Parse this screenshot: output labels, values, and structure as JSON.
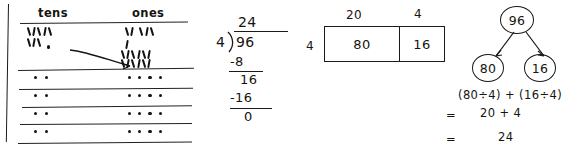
{
  "place_value_chart": {
    "headers": {
      "tens": "tens",
      "ones": "ones"
    },
    "regroup_arrow": "regroup-arrow-tens-to-ones",
    "top_row": {
      "tens_marks": 8,
      "tens_mark_glyph": "tally-stick",
      "ones_marks": 16,
      "ones_mark_glyph": "tally-stick"
    },
    "group_rows": [
      {
        "tens_dots": 2,
        "ones_dots": 4
      },
      {
        "tens_dots": 2,
        "ones_dots": 4
      },
      {
        "tens_dots": 2,
        "ones_dots": 4
      },
      {
        "tens_dots": 2,
        "ones_dots": 4
      }
    ]
  },
  "long_division": {
    "quotient": "24",
    "divisor": "4",
    "dividend": "96",
    "step1": "-8",
    "step2": "16",
    "step3": "-16",
    "remainder": "0",
    "bracket_glyph": "long-division-bracket"
  },
  "area_model": {
    "side_label": "4",
    "top_labels": [
      "20",
      "4"
    ],
    "cells": [
      "80",
      "16"
    ]
  },
  "number_bond": {
    "whole": "96",
    "parts": [
      "80",
      "16"
    ],
    "expression": "(80÷4) + (16÷4)",
    "line2_equals": "=",
    "line2": "20   +   4",
    "line3_equals": "=",
    "line3": "24"
  }
}
